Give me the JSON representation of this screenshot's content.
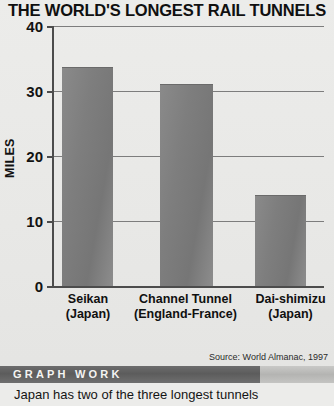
{
  "chart_data": {
    "type": "bar",
    "title": "THE WORLD'S LONGEST RAIL TUNNELS",
    "xlabel": "",
    "ylabel": "MILES",
    "ylim": [
      0,
      40
    ],
    "yticks": [
      0,
      10,
      20,
      30,
      40
    ],
    "ytick_labels": [
      "0",
      "10",
      "20",
      "30",
      "40"
    ],
    "grid": true,
    "legend": "none",
    "categories": [
      "Seikan (Japan)",
      "Channel Tunnel (England-France)",
      "Dai-shimizu (Japan)"
    ],
    "category_lines": [
      {
        "line1": "Seikan",
        "line2": "(Japan)"
      },
      {
        "line1": "Channel Tunnel",
        "line2": "(England-France)"
      },
      {
        "line1": "Dai-shimizu",
        "line2": "(Japan)"
      }
    ],
    "values": [
      33.5,
      31,
      13.8
    ],
    "bar_color": "#7e7e7e",
    "source": "Source: World Almanac, 1997"
  },
  "banner": {
    "label": "GRAPH WORK"
  },
  "caption": {
    "text": "Japan has two of the three longest tunnels"
  },
  "colors": {
    "background": "#ececea",
    "axis": "#4c4c4c",
    "gridline": "#7d7d7d",
    "bar": "#7e7e7e",
    "banner_bar": "#5c5c5c",
    "banner_text": "#f4f4f2",
    "text": "#101010"
  }
}
